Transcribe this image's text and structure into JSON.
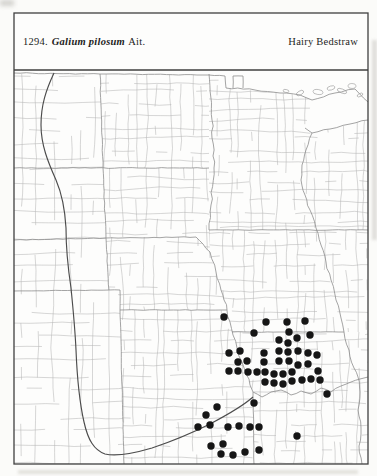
{
  "header": {
    "number": "1294.",
    "species": "Galium pilosum",
    "authority": "Ait.",
    "common_name": "Hairy Bedstraw"
  },
  "map": {
    "description": "County-level dot distribution map of the Great Plains region (Dakotas, Minnesota, Nebraska, Iowa, Kansas, Missouri) with occurrence dots concentrated in eastern Kansas and western Missouri",
    "marker_color": "#161616",
    "marker_radius": 3.7,
    "marker_count": 58,
    "frame_color": "#3f3f3f",
    "county_line_color": "#b6b6b6",
    "state_line_color": "#8d8d8d",
    "plains_boundary_color": "#4c4c4c",
    "paper_color": "#fdfdfc"
  },
  "chart_data": {
    "type": "scatter",
    "units": "pixel coordinates on 377x476 map, one dot = one county record",
    "points": [
      [
        224,
        317
      ],
      [
        266,
        322
      ],
      [
        287,
        322
      ],
      [
        305,
        321
      ],
      [
        254,
        333
      ],
      [
        289,
        332
      ],
      [
        310,
        335
      ],
      [
        297,
        338
      ],
      [
        279,
        340
      ],
      [
        288,
        343
      ],
      [
        229,
        353
      ],
      [
        240,
        351
      ],
      [
        264,
        353
      ],
      [
        279,
        351
      ],
      [
        288,
        352
      ],
      [
        298,
        351
      ],
      [
        308,
        353
      ],
      [
        317,
        355
      ],
      [
        238,
        362
      ],
      [
        247,
        361
      ],
      [
        264,
        362
      ],
      [
        279,
        361
      ],
      [
        289,
        361
      ],
      [
        298,
        365
      ],
      [
        308,
        364
      ],
      [
        229,
        371
      ],
      [
        238,
        371
      ],
      [
        248,
        372
      ],
      [
        257,
        372
      ],
      [
        265,
        372
      ],
      [
        274,
        374
      ],
      [
        283,
        374
      ],
      [
        292,
        372
      ],
      [
        318,
        371
      ],
      [
        265,
        382
      ],
      [
        274,
        383
      ],
      [
        283,
        384
      ],
      [
        292,
        381
      ],
      [
        302,
        380
      ],
      [
        311,
        379
      ],
      [
        320,
        380
      ],
      [
        327,
        394
      ],
      [
        254,
        403
      ],
      [
        217,
        407
      ],
      [
        206,
        415
      ],
      [
        198,
        427
      ],
      [
        210,
        425
      ],
      [
        228,
        427
      ],
      [
        239,
        426
      ],
      [
        250,
        427
      ],
      [
        259,
        427
      ],
      [
        297,
        436
      ],
      [
        211,
        446
      ],
      [
        223,
        444
      ],
      [
        221,
        454
      ],
      [
        233,
        455
      ],
      [
        245,
        452
      ],
      [
        259,
        450
      ]
    ]
  }
}
